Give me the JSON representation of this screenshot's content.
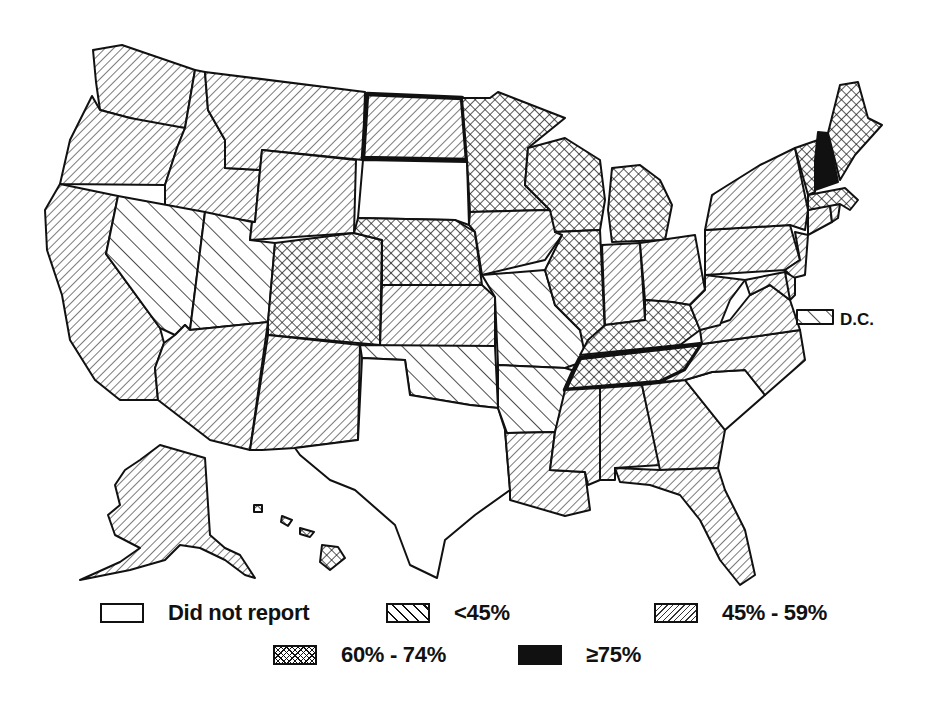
{
  "map": {
    "title": "",
    "categories": [
      {
        "id": "none",
        "label": "Did not report",
        "pattern": "blank",
        "color": "#ffffff"
      },
      {
        "id": "lt45",
        "label": "<45%",
        "pattern": "wide-backslash-hatch",
        "color": "#111111"
      },
      {
        "id": "45to59",
        "label": "45% - 59%",
        "pattern": "fine-forward-diagonal-hatch",
        "color": "#333333"
      },
      {
        "id": "60to74",
        "label": "60% - 74%",
        "pattern": "crosshatch",
        "color": "#111111"
      },
      {
        "id": "ge75",
        "label": "≥75%",
        "pattern": "solid",
        "color": "#111111"
      }
    ],
    "dc_label": "D.C.",
    "states": {
      "WA": "45to59",
      "OR": "45to59",
      "CA": "45to59",
      "ID": "45to59",
      "NV": "lt45",
      "UT": "lt45",
      "AZ": "45to59",
      "MT": "45to59",
      "WY": "45to59",
      "CO": "60to74",
      "NM": "45to59",
      "ND": "45to59",
      "SD": "none",
      "NE": "60to74",
      "KS": "45to59",
      "OK": "lt45",
      "TX": "none",
      "MN": "60to74",
      "IA": "45to59",
      "MO": "lt45",
      "AR": "lt45",
      "LA": "45to59",
      "WI": "60to74",
      "IL": "60to74",
      "MI": "60to74",
      "IN": "45to59",
      "OH": "45to59",
      "KY": "60to74",
      "TN": "60to74",
      "MS": "45to59",
      "AL": "45to59",
      "GA": "45to59",
      "FL": "45to59",
      "SC": "none",
      "NC": "45to59",
      "VA": "45to59",
      "WV": "45to59",
      "PA": "45to59",
      "NY": "45to59",
      "NJ": "45to59",
      "DE": "45to59",
      "MD": "45to59",
      "CT": "45to59",
      "RI": "45to59",
      "MA": "60to74",
      "VT": "60to74",
      "NH": "ge75",
      "ME": "60to74",
      "AK": "45to59",
      "HI": "60to74",
      "DC": "lt45"
    },
    "bold_outlined_states": [
      "ND",
      "TN"
    ]
  },
  "legend": {
    "row1": [
      "Did not report",
      "<45%",
      "45% - 59%"
    ],
    "row2": [
      "60% - 74%",
      "≥75%"
    ]
  }
}
